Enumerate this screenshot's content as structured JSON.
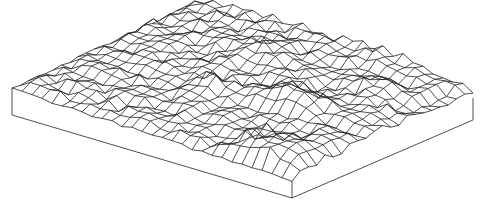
{
  "figure": {
    "title": "Isometric wireframe terrain surface on block base",
    "background": "#ffffff",
    "line_color": "#222222",
    "line_width": 0.8
  },
  "geometry": {
    "corner_left_top": [
      12,
      88
    ],
    "corner_front_top": [
      292,
      181
    ],
    "corner_right_top": [
      473,
      98
    ],
    "base_depth_left": 27,
    "base_depth_front": 17,
    "base_depth_right": 22,
    "grid_rows": 22,
    "grid_cols": 28,
    "height_scale": 14,
    "seed": 7
  }
}
